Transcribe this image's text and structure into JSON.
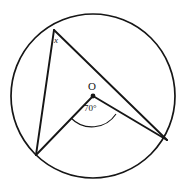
{
  "figure": {
    "background_color": "#ffffff",
    "stroke_color": "#161616",
    "labels": {
      "vertex_top": "x",
      "center": "O",
      "central_angle": "70°"
    },
    "geometry": {
      "circle": {
        "cx": 93,
        "cy": 96,
        "r": 82
      },
      "center_point": {
        "cx": 93,
        "cy": 96,
        "r": 2.4
      },
      "points": {
        "A_top": {
          "x": 54,
          "y": 30
        },
        "B_bottom_left": {
          "x": 36,
          "y": 155
        },
        "C_right": {
          "x": 167,
          "y": 140
        },
        "O_center": {
          "x": 93,
          "y": 96
        }
      },
      "segments": [
        {
          "name": "chord-a-to-b",
          "x1": 54,
          "y1": 30,
          "x2": 36,
          "y2": 155
        },
        {
          "name": "chord-a-to-c",
          "x1": 54,
          "y1": 30,
          "x2": 167,
          "y2": 140
        },
        {
          "name": "radius-o-to-b",
          "x1": 93,
          "y1": 96,
          "x2": 36,
          "y2": 155
        },
        {
          "name": "radius-o-to-c",
          "x1": 93,
          "y1": 96,
          "x2": 167,
          "y2": 140
        }
      ],
      "angle_arc": {
        "name": "central-angle-arc",
        "d": "M 71 118 A 29 29 0 0 0 116 114",
        "measure_degrees": 70
      }
    }
  }
}
